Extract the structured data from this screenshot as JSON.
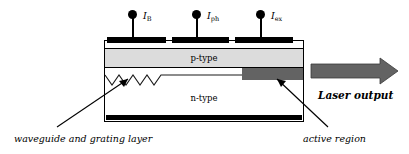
{
  "figure": {
    "type": "semiconductor-laser-cross-section",
    "terminals": [
      {
        "label": "I",
        "subscript": "B",
        "name": "current-bragg"
      },
      {
        "label": "I",
        "subscript": "ph",
        "name": "current-phase"
      },
      {
        "label": "I",
        "subscript": "ex",
        "name": "current-excitation"
      }
    ],
    "layers": [
      {
        "id": "p-type",
        "label": "p-type",
        "color": "#dcdcdc"
      },
      {
        "id": "n-type",
        "label": "n-type",
        "color": "#ffffff"
      }
    ],
    "active_region": {
      "label": "active region",
      "color": "#636363"
    },
    "waveguide": {
      "label": "waveguide and grating layer",
      "teeth": 5
    },
    "output": {
      "label": "Laser output",
      "arrow_color": "#636363"
    },
    "colors": {
      "outline": "#000000",
      "electrode": "#000000",
      "p_type_fill": "#dcdcdc",
      "active_fill": "#636363",
      "background": "#ffffff"
    }
  }
}
